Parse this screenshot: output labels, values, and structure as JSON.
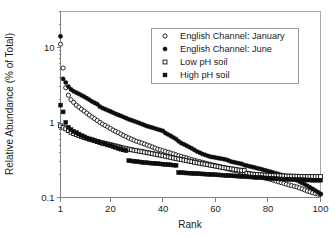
{
  "chart_data": {
    "type": "scatter",
    "title": "",
    "xlabel": "Rank",
    "ylabel": "Relative Abundance (% of Total)",
    "yscale": "log",
    "xscale": "linear",
    "xlim": [
      1,
      100
    ],
    "ylim": [
      0.1,
      30
    ],
    "xticks": [
      1,
      20,
      40,
      60,
      80,
      100
    ],
    "xticklabels": [
      "1",
      "20",
      "40",
      "60",
      "80",
      "100"
    ],
    "yticks": [
      0.1,
      1,
      10
    ],
    "yticklabels": [
      "0.1",
      "1",
      "10"
    ],
    "grid": false,
    "legend_position": "top-right",
    "series": [
      {
        "name": "English Channel: January",
        "marker": "open-circle",
        "x": [
          1,
          2,
          3,
          4,
          5,
          6,
          7,
          8,
          9,
          10,
          11,
          12,
          13,
          14,
          15,
          16,
          17,
          18,
          19,
          20,
          21,
          22,
          23,
          24,
          25,
          26,
          27,
          28,
          29,
          30,
          31,
          32,
          33,
          34,
          35,
          36,
          37,
          38,
          39,
          40,
          41,
          42,
          43,
          44,
          45,
          46,
          47,
          48,
          49,
          50,
          51,
          52,
          53,
          54,
          55,
          56,
          57,
          58,
          59,
          60,
          61,
          62,
          63,
          64,
          65,
          66,
          67,
          68,
          69,
          70,
          71,
          72,
          73,
          74,
          75,
          76,
          77,
          78,
          79,
          80,
          81,
          82,
          83,
          84,
          85,
          86,
          87,
          88,
          89,
          90,
          91,
          92,
          93,
          94,
          95,
          96,
          97,
          98,
          99,
          100
        ],
        "y": [
          11.0,
          5.3,
          2.9,
          2.3,
          2.0,
          1.85,
          1.7,
          1.6,
          1.5,
          1.42,
          1.33,
          1.25,
          1.18,
          1.12,
          1.06,
          1.0,
          0.95,
          0.91,
          0.87,
          0.83,
          0.79,
          0.76,
          0.73,
          0.7,
          0.67,
          0.645,
          0.62,
          0.6,
          0.58,
          0.56,
          0.545,
          0.53,
          0.515,
          0.5,
          0.485,
          0.47,
          0.455,
          0.44,
          0.43,
          0.42,
          0.41,
          0.4,
          0.39,
          0.38,
          0.37,
          0.36,
          0.352,
          0.344,
          0.336,
          0.328,
          0.32,
          0.313,
          0.306,
          0.3,
          0.294,
          0.288,
          0.282,
          0.276,
          0.27,
          0.265,
          0.26,
          0.255,
          0.25,
          0.245,
          0.24,
          0.235,
          0.23,
          0.226,
          0.222,
          0.218,
          0.214,
          0.21,
          0.206,
          0.202,
          0.198,
          0.194,
          0.19,
          0.186,
          0.182,
          0.178,
          0.174,
          0.17,
          0.166,
          0.162,
          0.158,
          0.154,
          0.15,
          0.147,
          0.144,
          0.141,
          0.138,
          0.134,
          0.13,
          0.126,
          0.122,
          0.119,
          0.116,
          0.113,
          0.111,
          0.11
        ]
      },
      {
        "name": "English Channel: June",
        "marker": "filled-circle",
        "x": [
          1,
          2,
          3,
          4,
          5,
          6,
          7,
          8,
          9,
          10,
          11,
          12,
          13,
          14,
          15,
          16,
          17,
          18,
          19,
          20,
          21,
          22,
          23,
          24,
          25,
          26,
          27,
          28,
          29,
          30,
          31,
          32,
          33,
          34,
          35,
          36,
          37,
          38,
          39,
          40,
          41,
          42,
          43,
          44,
          45,
          46,
          47,
          48,
          49,
          50,
          51,
          52,
          53,
          54,
          55,
          56,
          57,
          58,
          59,
          60,
          61,
          62,
          63,
          64,
          65,
          66,
          67,
          68,
          69,
          70,
          71,
          72,
          73,
          74,
          75,
          76,
          77,
          78,
          79,
          80,
          81,
          82,
          83,
          84,
          85,
          86,
          87,
          88,
          89,
          90,
          91,
          92,
          93,
          94,
          95,
          96,
          97,
          98,
          99,
          100
        ],
        "y": [
          14.0,
          3.8,
          3.4,
          3.0,
          2.75,
          2.6,
          2.5,
          2.4,
          2.3,
          2.2,
          2.1,
          2.0,
          1.9,
          1.82,
          1.75,
          1.62,
          1.55,
          1.5,
          1.45,
          1.4,
          1.35,
          1.3,
          1.26,
          1.22,
          1.18,
          1.14,
          1.1,
          1.07,
          1.04,
          1.01,
          0.98,
          0.95,
          0.92,
          0.89,
          0.87,
          0.85,
          0.83,
          0.81,
          0.79,
          0.77,
          0.72,
          0.69,
          0.66,
          0.63,
          0.6,
          0.56,
          0.53,
          0.51,
          0.49,
          0.47,
          0.45,
          0.43,
          0.41,
          0.395,
          0.38,
          0.37,
          0.36,
          0.35,
          0.345,
          0.34,
          0.335,
          0.33,
          0.325,
          0.32,
          0.31,
          0.3,
          0.295,
          0.29,
          0.285,
          0.28,
          0.27,
          0.265,
          0.26,
          0.255,
          0.25,
          0.245,
          0.24,
          0.235,
          0.23,
          0.225,
          0.22,
          0.215,
          0.21,
          0.205,
          0.2,
          0.195,
          0.19,
          0.185,
          0.18,
          0.175,
          0.17,
          0.163,
          0.156,
          0.15,
          0.143,
          0.136,
          0.13,
          0.124,
          0.118,
          0.112
        ]
      },
      {
        "name": "Low pH soil",
        "marker": "open-square",
        "x": [
          1,
          2,
          3,
          4,
          5,
          6,
          7,
          8,
          9,
          10,
          11,
          12,
          13,
          14,
          15,
          16,
          17,
          18,
          19,
          20,
          21,
          22,
          23,
          24,
          25,
          26,
          27,
          28,
          29,
          30,
          31,
          32,
          33,
          34,
          35,
          36,
          37,
          38,
          39,
          40,
          41,
          42,
          43,
          44,
          45,
          46,
          47,
          48,
          49,
          50,
          51,
          52,
          53,
          54,
          55,
          56,
          57,
          58,
          59,
          60,
          61,
          62,
          63,
          64,
          65,
          66,
          67,
          68,
          69,
          70,
          71,
          72,
          73,
          74,
          75,
          76,
          77,
          78,
          79,
          80,
          81,
          82,
          83,
          84,
          85,
          86,
          87,
          88,
          89,
          90,
          91,
          92,
          93,
          94,
          95,
          96,
          97,
          98,
          99,
          100
        ],
        "y": [
          0.9,
          0.86,
          0.82,
          0.78,
          0.74,
          0.71,
          0.69,
          0.67,
          0.65,
          0.63,
          0.615,
          0.6,
          0.585,
          0.57,
          0.555,
          0.545,
          0.535,
          0.525,
          0.515,
          0.505,
          0.495,
          0.485,
          0.475,
          0.465,
          0.455,
          0.447,
          0.44,
          0.433,
          0.426,
          0.42,
          0.414,
          0.408,
          0.402,
          0.396,
          0.39,
          0.384,
          0.378,
          0.372,
          0.366,
          0.36,
          0.354,
          0.348,
          0.342,
          0.336,
          0.33,
          0.325,
          0.32,
          0.315,
          0.31,
          0.305,
          0.3,
          0.295,
          0.29,
          0.286,
          0.282,
          0.278,
          0.274,
          0.27,
          0.266,
          0.262,
          0.258,
          0.254,
          0.25,
          0.247,
          0.244,
          0.241,
          0.238,
          0.235,
          0.232,
          0.23,
          0.228,
          0.21,
          0.207,
          0.205,
          0.203,
          0.202,
          0.201,
          0.2,
          0.199,
          0.198,
          0.197,
          0.196,
          0.195,
          0.195,
          0.194,
          0.194,
          0.193,
          0.193,
          0.192,
          0.192,
          0.192,
          0.191,
          0.191,
          0.191,
          0.19,
          0.19,
          0.19,
          0.19,
          0.19,
          0.19
        ]
      },
      {
        "name": "High pH soil",
        "marker": "filled-square",
        "x": [
          1,
          2,
          3,
          4,
          5,
          6,
          7,
          8,
          9,
          10,
          11,
          12,
          13,
          14,
          15,
          16,
          17,
          18,
          19,
          20,
          21,
          22,
          23,
          24,
          25,
          26,
          27,
          28,
          29,
          30,
          31,
          32,
          33,
          34,
          35,
          36,
          37,
          38,
          39,
          40,
          41,
          42,
          43,
          44,
          45,
          46,
          47,
          48,
          49,
          50,
          51,
          52,
          53,
          54,
          55,
          56,
          57,
          58,
          59,
          60,
          61,
          62,
          63,
          64,
          65,
          66,
          67,
          68,
          69,
          70,
          71,
          72,
          73,
          74,
          75,
          76,
          77,
          78,
          79,
          80,
          81,
          82,
          83,
          84,
          85,
          86,
          87,
          88,
          89,
          90,
          91,
          92,
          93,
          94,
          95,
          96,
          97,
          98,
          99,
          100
        ],
        "y": [
          1.7,
          1.38,
          1.0,
          0.86,
          0.8,
          0.76,
          0.73,
          0.7,
          0.67,
          0.645,
          0.62,
          0.6,
          0.585,
          0.57,
          0.555,
          0.54,
          0.525,
          0.515,
          0.5,
          0.49,
          0.475,
          0.465,
          0.45,
          0.44,
          0.43,
          0.42,
          0.31,
          0.307,
          0.304,
          0.301,
          0.298,
          0.295,
          0.292,
          0.29,
          0.288,
          0.286,
          0.284,
          0.282,
          0.28,
          0.278,
          0.276,
          0.274,
          0.272,
          0.27,
          0.268,
          0.215,
          0.214,
          0.213,
          0.212,
          0.211,
          0.21,
          0.209,
          0.208,
          0.207,
          0.206,
          0.205,
          0.204,
          0.203,
          0.202,
          0.201,
          0.2,
          0.199,
          0.198,
          0.197,
          0.196,
          0.195,
          0.194,
          0.193,
          0.192,
          0.191,
          0.19,
          0.189,
          0.188,
          0.187,
          0.186,
          0.185,
          0.184,
          0.183,
          0.182,
          0.181,
          0.18,
          0.179,
          0.178,
          0.177,
          0.176,
          0.176,
          0.175,
          0.175,
          0.174,
          0.174,
          0.173,
          0.173,
          0.172,
          0.172,
          0.171,
          0.171,
          0.17,
          0.17,
          0.17,
          0.17
        ]
      }
    ]
  },
  "legend": {
    "items": [
      {
        "label": "English Channel: January",
        "marker": "open-circle"
      },
      {
        "label": "English Channel: June",
        "marker": "filled-circle"
      },
      {
        "label": "Low pH soil",
        "marker": "open-square"
      },
      {
        "label": "High pH soil",
        "marker": "filled-square"
      }
    ]
  },
  "colors": {
    "marker": "#0d0d0d",
    "axis": "#7f7f7f",
    "frame": "#a8a8a8",
    "text": "#1a1a1a",
    "background": "#ffffff"
  }
}
